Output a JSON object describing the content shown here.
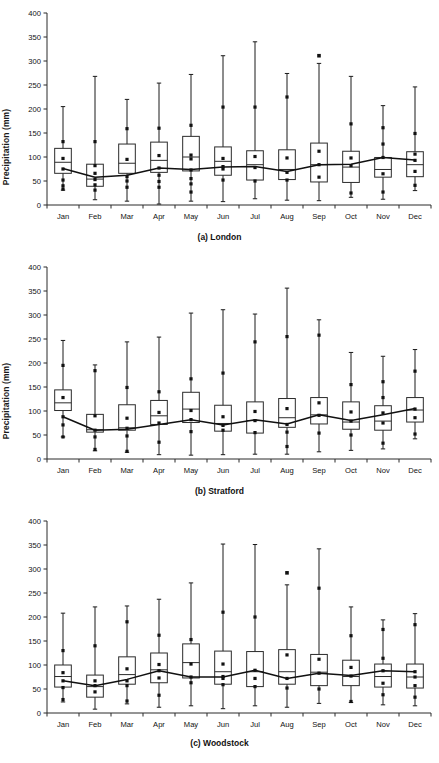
{
  "figure": {
    "ylabel": "Precipitation (mm)",
    "y_ticks": [
      "0",
      "50",
      "100",
      "150",
      "200",
      "250",
      "300",
      "350",
      "400"
    ],
    "months": [
      "Jan",
      "Feb",
      "Mar",
      "Apr",
      "May",
      "Jun",
      "Jul",
      "Aug",
      "Sep",
      "Oct",
      "Nov",
      "Dec"
    ],
    "captions": {
      "a": "(a) London",
      "b": "(b) Stratford",
      "c": "(c) Woodstock"
    }
  },
  "chart_data": [
    {
      "type": "box",
      "title": "(a) London",
      "xlabel": "",
      "ylabel": "Precipitation (mm)",
      "ylim": [
        0,
        400
      ],
      "yticks": [
        0,
        50,
        100,
        150,
        200,
        250,
        300,
        350,
        400
      ],
      "grid": false,
      "legend": "none",
      "categories": [
        "Jan",
        "Feb",
        "Mar",
        "Apr",
        "May",
        "Jun",
        "Jul",
        "Aug",
        "Sep",
        "Oct",
        "Nov",
        "Dec"
      ],
      "boxes": [
        {
          "category": "Jan",
          "min": 31,
          "q1": 66,
          "median": 89,
          "q3": 118,
          "max": 205,
          "points": [
            132,
            97,
            75,
            52,
            40,
            33
          ]
        },
        {
          "category": "Feb",
          "min": 11,
          "q1": 39,
          "median": 54,
          "q3": 85,
          "max": 268,
          "points": [
            132,
            82,
            66,
            53,
            42,
            31
          ]
        },
        {
          "category": "Mar",
          "min": 8,
          "q1": 66,
          "median": 87,
          "q3": 127,
          "max": 220,
          "points": [
            159,
            95,
            59,
            50,
            37
          ]
        },
        {
          "category": "Apr",
          "min": 2,
          "q1": 68,
          "median": 93,
          "q3": 131,
          "max": 254,
          "points": [
            160,
            103,
            77,
            62,
            49,
            37
          ]
        },
        {
          "category": "May",
          "min": 8,
          "q1": 71,
          "median": 100,
          "q3": 143,
          "max": 272,
          "points": [
            166,
            104,
            96,
            73,
            55,
            44,
            27
          ]
        },
        {
          "category": "Jun",
          "min": 7,
          "q1": 62,
          "median": 91,
          "q3": 121,
          "max": 311,
          "points": [
            204,
            97,
            80,
            75,
            52
          ]
        },
        {
          "category": "Jul",
          "min": 13,
          "q1": 52,
          "median": 84,
          "q3": 113,
          "max": 340,
          "points": [
            204,
            101,
            78,
            50
          ]
        },
        {
          "category": "Aug",
          "min": 10,
          "q1": 53,
          "median": 74,
          "q3": 115,
          "max": 274,
          "points": [
            225,
            98,
            68,
            52
          ]
        },
        {
          "category": "Sep",
          "min": 9,
          "q1": 48,
          "median": 84,
          "q3": 129,
          "max": 295,
          "outliers": [
            311
          ],
          "points": [
            112,
            84,
            58
          ]
        },
        {
          "category": "Oct",
          "min": 16,
          "q1": 47,
          "median": 79,
          "q3": 112,
          "max": 268,
          "points": [
            169,
            98,
            82,
            25
          ]
        },
        {
          "category": "Nov",
          "min": 12,
          "q1": 58,
          "median": 74,
          "q3": 99,
          "max": 207,
          "points": [
            161,
            127,
            99,
            65,
            27
          ]
        },
        {
          "category": "Dec",
          "min": 30,
          "q1": 59,
          "median": 84,
          "q3": 111,
          "max": 246,
          "points": [
            149,
            106,
            93,
            70,
            41
          ]
        }
      ],
      "trend_name": "mean line",
      "trend": [
        76,
        58,
        62,
        77,
        74,
        79,
        80,
        70,
        84,
        85,
        99,
        94
      ]
    },
    {
      "type": "box",
      "title": "(b) Stratford",
      "xlabel": "",
      "ylabel": "Precipitation (mm)",
      "ylim": [
        0,
        400
      ],
      "yticks": [
        0,
        50,
        100,
        150,
        200,
        250,
        300,
        350,
        400
      ],
      "grid": false,
      "legend": "none",
      "categories": [
        "Jan",
        "Feb",
        "Mar",
        "Apr",
        "May",
        "Jun",
        "Jul",
        "Aug",
        "Sep",
        "Oct",
        "Nov",
        "Dec"
      ],
      "boxes": [
        {
          "category": "Jan",
          "min": 46,
          "q1": 101,
          "median": 117,
          "q3": 144,
          "max": 247,
          "points": [
            195,
            128,
            88,
            71,
            46
          ]
        },
        {
          "category": "Feb",
          "min": 17,
          "q1": 56,
          "median": 61,
          "q3": 93,
          "max": 196,
          "points": [
            184,
            90,
            60,
            46,
            20
          ]
        },
        {
          "category": "Mar",
          "min": 14,
          "q1": 60,
          "median": 65,
          "q3": 113,
          "max": 244,
          "points": [
            149,
            85,
            64,
            48,
            16
          ]
        },
        {
          "category": "Apr",
          "min": 9,
          "q1": 72,
          "median": 90,
          "q3": 122,
          "max": 254,
          "points": [
            140,
            97,
            75,
            35
          ]
        },
        {
          "category": "May",
          "min": 8,
          "q1": 76,
          "median": 104,
          "q3": 139,
          "max": 304,
          "points": [
            167,
            101,
            82,
            57
          ]
        },
        {
          "category": "Jun",
          "min": 9,
          "q1": 58,
          "median": 74,
          "q3": 112,
          "max": 311,
          "points": [
            179,
            88,
            70,
            60
          ]
        },
        {
          "category": "Jul",
          "min": 10,
          "q1": 54,
          "median": 80,
          "q3": 119,
          "max": 302,
          "points": [
            244,
            99,
            80,
            55
          ]
        },
        {
          "category": "Aug",
          "min": 10,
          "q1": 66,
          "median": 86,
          "q3": 126,
          "max": 356,
          "points": [
            255,
            105,
            72,
            56,
            26
          ]
        },
        {
          "category": "Sep",
          "min": 15,
          "q1": 73,
          "median": 92,
          "q3": 128,
          "max": 290,
          "points": [
            258,
            117,
            91,
            54
          ]
        },
        {
          "category": "Oct",
          "min": 18,
          "q1": 62,
          "median": 77,
          "q3": 119,
          "max": 222,
          "points": [
            155,
            98,
            79,
            50
          ]
        },
        {
          "category": "Nov",
          "min": 21,
          "q1": 60,
          "median": 79,
          "q3": 111,
          "max": 214,
          "points": [
            161,
            128,
            96,
            75,
            33
          ]
        },
        {
          "category": "Dec",
          "min": 42,
          "q1": 77,
          "median": 102,
          "q3": 128,
          "max": 228,
          "points": [
            183,
            104,
            86,
            52
          ]
        }
      ],
      "trend_name": "mean line",
      "trend": [
        88,
        60,
        62,
        72,
        82,
        71,
        82,
        73,
        92,
        80,
        92,
        105
      ]
    },
    {
      "type": "box",
      "title": "(c) Woodstock",
      "xlabel": "",
      "ylabel": "Precipitation (mm)",
      "ylim": [
        0,
        400
      ],
      "yticks": [
        0,
        50,
        100,
        150,
        200,
        250,
        300,
        350,
        400
      ],
      "grid": false,
      "legend": "none",
      "categories": [
        "Jan",
        "Feb",
        "Mar",
        "Apr",
        "May",
        "Jun",
        "Jul",
        "Aug",
        "Sep",
        "Oct",
        "Nov",
        "Dec"
      ],
      "boxes": [
        {
          "category": "Jan",
          "min": 23,
          "q1": 54,
          "median": 76,
          "q3": 100,
          "max": 208,
          "points": [
            130,
            84,
            67,
            53,
            28
          ]
        },
        {
          "category": "Feb",
          "min": 8,
          "q1": 33,
          "median": 55,
          "q3": 79,
          "max": 221,
          "points": [
            140,
            67,
            57,
            44
          ]
        },
        {
          "category": "Mar",
          "min": 19,
          "q1": 60,
          "median": 80,
          "q3": 117,
          "max": 223,
          "points": [
            190,
            92,
            67,
            57,
            25
          ]
        },
        {
          "category": "Apr",
          "min": 12,
          "q1": 63,
          "median": 90,
          "q3": 125,
          "max": 237,
          "points": [
            162,
            101,
            88,
            73,
            37
          ]
        },
        {
          "category": "May",
          "min": 15,
          "q1": 73,
          "median": 105,
          "q3": 144,
          "max": 271,
          "points": [
            153,
            102,
            75,
            63
          ]
        },
        {
          "category": "Jun",
          "min": 9,
          "q1": 60,
          "median": 86,
          "q3": 129,
          "max": 352,
          "points": [
            210,
            102,
            76,
            72,
            59
          ]
        },
        {
          "category": "Jul",
          "min": 15,
          "q1": 55,
          "median": 86,
          "q3": 128,
          "max": 351,
          "points": [
            200,
            89,
            72,
            55
          ]
        },
        {
          "category": "Aug",
          "min": 12,
          "q1": 60,
          "median": 86,
          "q3": 132,
          "max": 267,
          "outliers": [
            292
          ],
          "points": [
            121,
            72,
            52
          ]
        },
        {
          "category": "Sep",
          "min": 20,
          "q1": 57,
          "median": 85,
          "q3": 122,
          "max": 342,
          "points": [
            260,
            112,
            83,
            50
          ]
        },
        {
          "category": "Oct",
          "min": 22,
          "q1": 57,
          "median": 76,
          "q3": 110,
          "max": 221,
          "points": [
            161,
            95,
            77,
            24
          ]
        },
        {
          "category": "Nov",
          "min": 17,
          "q1": 54,
          "median": 76,
          "q3": 102,
          "max": 194,
          "points": [
            174,
            114,
            88,
            62,
            38
          ]
        },
        {
          "category": "Dec",
          "min": 15,
          "q1": 52,
          "median": 75,
          "q3": 102,
          "max": 207,
          "points": [
            184,
            86,
            75,
            57,
            33
          ]
        }
      ],
      "trend_name": "mean line",
      "trend": [
        67,
        57,
        70,
        88,
        75,
        75,
        89,
        72,
        83,
        78,
        88,
        86
      ]
    }
  ]
}
